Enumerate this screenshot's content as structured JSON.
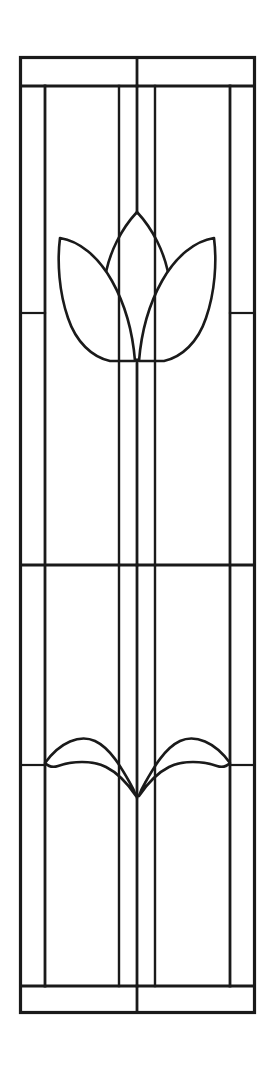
{
  "document": {
    "kind": "line-art-drawing",
    "subject": "stained glass window pattern",
    "motif": "tulip with two leaves",
    "background_color": "#ffffff",
    "line_color": "#1a1a1a",
    "width": 274,
    "height": 1072,
    "visible_text": ""
  },
  "drawing": {
    "frame": {
      "name": "outer-frame",
      "left": 20.5,
      "top": 57.5,
      "right": 254.5,
      "bottom": 1012.5,
      "stroke_width": 3.2
    },
    "bands": {
      "top_band_bottom_y": 86,
      "bottom_band_top_y": 986,
      "mid_divider_y": 565,
      "top_band_center_x": 137,
      "bottom_band_center_x": 137
    },
    "vertical_cames": [
      {
        "name": "left-border-came",
        "x": 45,
        "y1": 86,
        "y2": 986
      },
      {
        "name": "left-inner-came",
        "x": 119,
        "y1": 86,
        "y2": 986
      },
      {
        "name": "center-stem-came",
        "x": 137,
        "y1": 86,
        "y2": 986
      },
      {
        "name": "right-inner-came",
        "x": 155,
        "y1": 86,
        "y2": 986
      },
      {
        "name": "right-border-came",
        "x": 230,
        "y1": 86,
        "y2": 986
      }
    ],
    "side_cross_cames": [
      {
        "name": "left-panel-cross-upper",
        "x1": 20.5,
        "x2": 45,
        "y": 313
      },
      {
        "name": "right-panel-cross-upper",
        "x1": 230,
        "x2": 254.5,
        "y": 313
      },
      {
        "name": "left-panel-cross-lower",
        "x1": 20.5,
        "x2": 45,
        "y": 765
      },
      {
        "name": "right-panel-cross-lower",
        "x1": 230,
        "x2": 254.5,
        "y": 765
      }
    ],
    "tulip": {
      "name": "tulip-blossom",
      "center_x": 137,
      "tip_y": 212,
      "base_y": 362,
      "left_petal_tip_x": 60,
      "right_petal_tip_x": 214,
      "petal_shoulder_y": 238,
      "stem_top_y": 362,
      "stem_bottom_y": 565
    },
    "leaves": {
      "name": "tulip-leaves",
      "junction_x": 137,
      "junction_y": 796,
      "left_tip_x": 45,
      "right_tip_x": 230,
      "tip_y": 763,
      "crest_y": 741
    }
  },
  "panels": [
    {
      "name": "top-band-left-pane",
      "label": "top band left"
    },
    {
      "name": "top-band-right-pane",
      "label": "top band right"
    },
    {
      "name": "left-border-pane-upper",
      "label": "left border upper"
    },
    {
      "name": "left-border-pane-middle",
      "label": "left border middle"
    },
    {
      "name": "left-border-pane-lower",
      "label": "left border lower"
    },
    {
      "name": "right-border-pane-upper",
      "label": "right border upper"
    },
    {
      "name": "right-border-pane-middle",
      "label": "right border middle"
    },
    {
      "name": "right-border-pane-lower",
      "label": "right border lower"
    },
    {
      "name": "upper-field-pane",
      "label": "upper field with tulip"
    },
    {
      "name": "lower-field-pane",
      "label": "lower field with leaves"
    },
    {
      "name": "bottom-band-left-pane",
      "label": "bottom band left"
    },
    {
      "name": "bottom-band-right-pane",
      "label": "bottom band right"
    }
  ]
}
